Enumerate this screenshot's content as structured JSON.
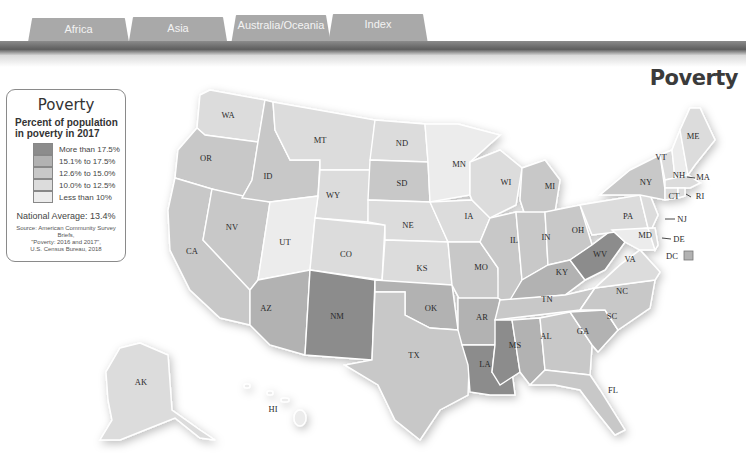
{
  "tabs": [
    {
      "label": "Africa"
    },
    {
      "label": "Asia"
    },
    {
      "label": "Australia/Oceania"
    },
    {
      "label": "Index"
    }
  ],
  "page": {
    "title": "Poverty"
  },
  "legend": {
    "title": "Poverty",
    "subtitle_line1": "Percent of population",
    "subtitle_line2": "in poverty in 2017",
    "classes": [
      {
        "label": "More than 17.5%",
        "color": "#8c8c8c"
      },
      {
        "label": "15.1% to 17.5%",
        "color": "#b2b2b2"
      },
      {
        "label": "12.6% to 15.0%",
        "color": "#c8c8c8"
      },
      {
        "label": "10.0% to 12.5%",
        "color": "#dcdcdc"
      },
      {
        "label": "Less than 10%",
        "color": "#ececec"
      }
    ],
    "national_average": "National Average: 13.4%",
    "source_line1": "Source: American Community Survey Briefs,",
    "source_line2": "\"Poverty: 2016 and 2017\",",
    "source_line3": "U.S. Census Bureau, 2018"
  },
  "map": {
    "states": {
      "WA": {
        "label": "WA",
        "class": 3
      },
      "OR": {
        "label": "OR",
        "class": 2
      },
      "ID": {
        "label": "ID",
        "class": 2
      },
      "MT": {
        "label": "MT",
        "class": 3
      },
      "WY": {
        "label": "WY",
        "class": 3
      },
      "ND": {
        "label": "ND",
        "class": 3
      },
      "SD": {
        "label": "SD",
        "class": 2
      },
      "NE": {
        "label": "NE",
        "class": 3
      },
      "KS": {
        "label": "KS",
        "class": 3
      },
      "CO": {
        "label": "CO",
        "class": 3
      },
      "UT": {
        "label": "UT",
        "class": 4
      },
      "NV": {
        "label": "NV",
        "class": 2
      },
      "CA": {
        "label": "CA",
        "class": 2
      },
      "AZ": {
        "label": "AZ",
        "class": 1
      },
      "NM": {
        "label": "NM",
        "class": 0
      },
      "OK": {
        "label": "OK",
        "class": 1
      },
      "TX": {
        "label": "TX",
        "class": 2
      },
      "MN": {
        "label": "MN",
        "class": 4
      },
      "IA": {
        "label": "IA",
        "class": 3
      },
      "MO": {
        "label": "MO",
        "class": 2
      },
      "AR": {
        "label": "AR",
        "class": 1
      },
      "LA": {
        "label": "LA",
        "class": 0
      },
      "WI": {
        "label": "WI",
        "class": 3
      },
      "IL": {
        "label": "IL",
        "class": 2
      },
      "MI": {
        "label": "MI",
        "class": 2
      },
      "IN": {
        "label": "IN",
        "class": 2
      },
      "OH": {
        "label": "OH",
        "class": 2
      },
      "KY": {
        "label": "KY",
        "class": 1
      },
      "TN": {
        "label": "TN",
        "class": 2
      },
      "MS": {
        "label": "MS",
        "class": 0
      },
      "AL": {
        "label": "AL",
        "class": 1
      },
      "GA": {
        "label": "GA",
        "class": 2
      },
      "FL": {
        "label": "FL",
        "class": 2
      },
      "SC": {
        "label": "SC",
        "class": 1
      },
      "NC": {
        "label": "NC",
        "class": 2
      },
      "VA": {
        "label": "VA",
        "class": 3
      },
      "WV": {
        "label": "WV",
        "class": 0
      },
      "PA": {
        "label": "PA",
        "class": 3
      },
      "NY": {
        "label": "NY",
        "class": 2
      },
      "VT": {
        "label": "VT",
        "class": 3
      },
      "NH": {
        "label": "NH",
        "class": 4
      },
      "ME": {
        "label": "ME",
        "class": 3
      },
      "MA": {
        "label": "MA",
        "class": 3
      },
      "RI": {
        "label": "RI",
        "class": 3
      },
      "CT": {
        "label": "CT",
        "class": 3
      },
      "NJ": {
        "label": "NJ",
        "class": 3
      },
      "DE": {
        "label": "DE",
        "class": 3
      },
      "MD": {
        "label": "MD",
        "class": 4
      },
      "DC": {
        "label": "DC",
        "class": 1
      },
      "AK": {
        "label": "AK",
        "class": 3
      },
      "HI": {
        "label": "HI",
        "class": 4
      }
    }
  }
}
